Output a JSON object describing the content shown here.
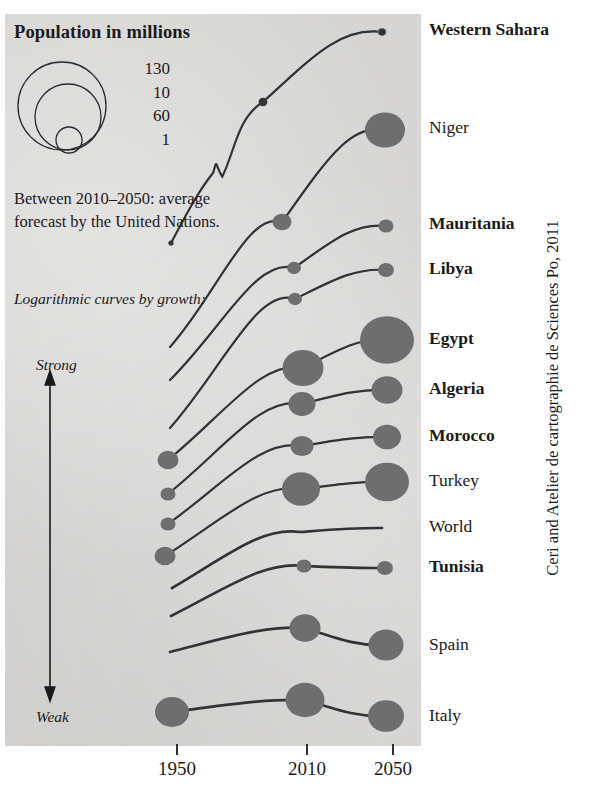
{
  "legend": {
    "title": "Population in millions",
    "sizes": [
      "130",
      "10",
      "60",
      "1"
    ],
    "note": "Between 2010–2050: average forecast by the United Nations.",
    "curve_label": "Logarithmic curves by growth:",
    "axis_strong": "Strong",
    "axis_weak": "Weak"
  },
  "credit": "Ceri and Atelier de cartographie de Sciences Po, 2011",
  "chart_data": {
    "type": "line",
    "title": "Population in millions",
    "subtitle": "Between 2010–2050: average forecast by the United Nations.",
    "xlabel": "",
    "ylabel": "",
    "grid": false,
    "legend_position": "top-left",
    "x": [
      "1950",
      "2010",
      "2050"
    ],
    "x_tick_labels": [
      "1950",
      "2010",
      "2050"
    ],
    "bubble_legend_values": [
      130,
      60,
      10,
      1
    ],
    "bubble_legend_labels_as_printed": [
      "130",
      "10",
      "60",
      "1"
    ],
    "growth_axis": {
      "top": "Strong",
      "bottom": "Weak"
    },
    "note": "Curve vertical order encodes growth rate: strongest growth at top, weakest at bottom. Marker area encodes population in millions.",
    "series": [
      {
        "name": "Western Sahara",
        "bold": true,
        "values": [
          0.03,
          0.5,
          1.2
        ],
        "marker_px": [
          0,
          4.5,
          4.5
        ]
      },
      {
        "name": "Niger",
        "bold": false,
        "values": [
          2.5,
          16,
          58
        ],
        "marker_px": [
          0,
          9.5,
          20
        ]
      },
      {
        "name": "Mauritania",
        "bold": true,
        "values": [
          0.7,
          3.5,
          7
        ],
        "marker_px": [
          0,
          7,
          7.5
        ]
      },
      {
        "name": "Libya",
        "bold": true,
        "values": [
          1.0,
          6.4,
          10
        ],
        "marker_px": [
          0,
          7,
          8
        ]
      },
      {
        "name": "Egypt",
        "bold": true,
        "values": [
          21,
          81,
          130
        ],
        "marker_px": [
          10.5,
          20.5,
          27
        ]
      },
      {
        "name": "Algeria",
        "bold": true,
        "values": [
          8.8,
          36,
          47
        ],
        "marker_px": [
          7.5,
          13.5,
          15.5
        ]
      },
      {
        "name": "Morocco",
        "bold": true,
        "values": [
          9,
          32,
          40
        ],
        "marker_px": [
          7.5,
          11.5,
          14
        ]
      },
      {
        "name": "Turkey",
        "bold": false,
        "values": [
          21,
          73,
          92
        ],
        "marker_px": [
          10.5,
          19,
          22
        ]
      },
      {
        "name": "World",
        "bold": false,
        "values": [
          2500,
          6900,
          9300
        ],
        "marker_px": [
          0,
          0,
          0
        ]
      },
      {
        "name": "Tunisia",
        "bold": true,
        "values": [
          3.5,
          10.5,
          13
        ],
        "marker_px": [
          0,
          7.5,
          8
        ]
      },
      {
        "name": "Spain",
        "bold": false,
        "values": [
          28,
          46,
          51
        ],
        "marker_px": [
          0,
          15.5,
          17.5
        ]
      },
      {
        "name": "Italy",
        "bold": false,
        "values": [
          46,
          60,
          59
        ],
        "marker_px": [
          17,
          19.5,
          18
        ]
      }
    ]
  },
  "countries": [
    {
      "label": "Western Sahara",
      "bold": true,
      "y": 30
    },
    {
      "label": "Niger",
      "bold": false,
      "y": 128
    },
    {
      "label": "Mauritania",
      "bold": true,
      "y": 224
    },
    {
      "label": "Libya",
      "bold": true,
      "y": 269
    },
    {
      "label": "Egypt",
      "bold": true,
      "y": 339
    },
    {
      "label": "Algeria",
      "bold": true,
      "y": 389
    },
    {
      "label": "Morocco",
      "bold": true,
      "y": 436
    },
    {
      "label": "Turkey",
      "bold": false,
      "y": 481
    },
    {
      "label": "World",
      "bold": false,
      "y": 527
    },
    {
      "label": "Tunisia",
      "bold": true,
      "y": 567
    },
    {
      "label": "Spain",
      "bold": false,
      "y": 645
    },
    {
      "label": "Italy",
      "bold": false,
      "y": 716
    }
  ],
  "xaxis": [
    {
      "label": "1950",
      "x": 177
    },
    {
      "label": "2010",
      "x": 307
    },
    {
      "label": "2050",
      "x": 393
    }
  ],
  "colors": {
    "panel": "#d6d5d3",
    "ink": "#1a1a1a",
    "bubble": "#6e6e6e",
    "curve": "#333333"
  }
}
